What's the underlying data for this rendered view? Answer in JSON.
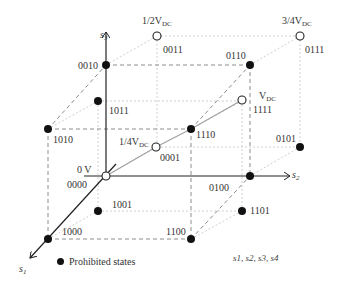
{
  "diagram": {
    "title": "",
    "axes": [
      {
        "name": "s1",
        "label": "s",
        "sub": "1"
      },
      {
        "name": "s2",
        "label": "s",
        "sub": "2"
      },
      {
        "name": "s3",
        "label": "s",
        "sub": "3"
      }
    ],
    "states": [
      {
        "code": "0000",
        "type": "allowed",
        "voltage": "0 V"
      },
      {
        "code": "0001",
        "type": "allowed",
        "voltage": "1/4V",
        "voltage_sub": "DC"
      },
      {
        "code": "0011",
        "type": "allowed",
        "voltage": "1/2V",
        "voltage_sub": "DC"
      },
      {
        "code": "0111",
        "type": "allowed",
        "voltage": "3/4V",
        "voltage_sub": "DC"
      },
      {
        "code": "1111",
        "type": "allowed",
        "voltage": "V",
        "voltage_sub": "DC"
      },
      {
        "code": "0010",
        "type": "prohibited"
      },
      {
        "code": "1010",
        "type": "prohibited"
      },
      {
        "code": "1011",
        "type": "prohibited"
      },
      {
        "code": "0110",
        "type": "prohibited"
      },
      {
        "code": "1110",
        "type": "prohibited"
      },
      {
        "code": "0100",
        "type": "prohibited"
      },
      {
        "code": "0101",
        "type": "prohibited"
      },
      {
        "code": "1000",
        "type": "prohibited"
      },
      {
        "code": "1001",
        "type": "prohibited"
      },
      {
        "code": "1100",
        "type": "prohibited"
      },
      {
        "code": "1101",
        "type": "prohibited"
      }
    ],
    "legend": {
      "label": "Prohibited states"
    },
    "note": "s1, s2, s3, s4",
    "colors": {
      "axis": "#222222",
      "dashed": "#9a9a9a",
      "faint": "#cccccc",
      "dot": "#111111"
    }
  }
}
